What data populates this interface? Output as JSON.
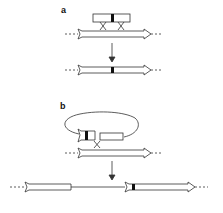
{
  "panels": [
    {
      "label": "a",
      "description": "Insertion via double crossover: plasmid insert with marker recombines into chromosomal gene"
    },
    {
      "label": "b",
      "description": "Insertion via single crossover: circular plasmid integrates, duplicating gene segment"
    }
  ],
  "colors": {
    "stroke": "#333333",
    "marker": "#111111",
    "background": "#ffffff"
  }
}
